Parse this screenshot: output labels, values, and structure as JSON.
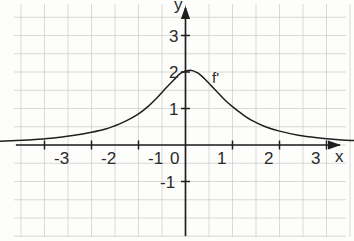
{
  "figure": {
    "background_color": "#fdfdfb",
    "grid_color": "#c9c9c9",
    "axis_color": "#1f1f1f",
    "curve_color": "#1f1f1f",
    "text_color": "#2a2a2a"
  },
  "axes": {
    "x_axis_label": "x",
    "y_axis_label": "y",
    "x_ticks": [
      {
        "value": -3,
        "label": "-3"
      },
      {
        "value": -2,
        "label": "-2"
      },
      {
        "value": -1,
        "label": "-1"
      },
      {
        "value": 0,
        "label": "0"
      },
      {
        "value": 1,
        "label": "1"
      },
      {
        "value": 2,
        "label": "2"
      },
      {
        "value": 3,
        "label": "3"
      }
    ],
    "y_ticks": [
      {
        "value": -1,
        "label": "-1"
      },
      {
        "value": 1,
        "label": "1"
      },
      {
        "value": 2,
        "label": "2"
      },
      {
        "value": 3,
        "label": "3"
      }
    ]
  },
  "curve": {
    "label": "f'",
    "peak_x": 0.1,
    "peak_y": 2.05
  },
  "chart_data": {
    "type": "line",
    "title": "",
    "subtitle": "",
    "xlabel": "x",
    "ylabel": "y",
    "xlim": [
      -3.95,
      3.6
    ],
    "ylim": [
      -1.75,
      3.9
    ],
    "grid": true,
    "grid_step": 0.5,
    "legend": "none",
    "annotations": [
      {
        "text": "f'",
        "x": 1.0,
        "y": 1.75
      }
    ],
    "series": [
      {
        "name": "f'",
        "x": [
          -3.95,
          -3.6,
          -3.2,
          -2.8,
          -2.4,
          -2.0,
          -1.7,
          -1.4,
          -1.2,
          -1.0,
          -0.8,
          -0.6,
          -0.4,
          -0.25,
          -0.1,
          0.1,
          0.25,
          0.4,
          0.55,
          0.7,
          0.85,
          1.0,
          1.2,
          1.4,
          1.7,
          2.0,
          2.4,
          2.8,
          3.2,
          3.6
        ],
        "y": [
          0.1,
          0.12,
          0.15,
          0.19,
          0.26,
          0.35,
          0.44,
          0.58,
          0.7,
          0.85,
          1.05,
          1.3,
          1.58,
          1.78,
          1.97,
          2.05,
          1.98,
          1.82,
          1.62,
          1.42,
          1.22,
          1.05,
          0.85,
          0.68,
          0.5,
          0.38,
          0.27,
          0.2,
          0.15,
          0.12
        ]
      }
    ]
  }
}
